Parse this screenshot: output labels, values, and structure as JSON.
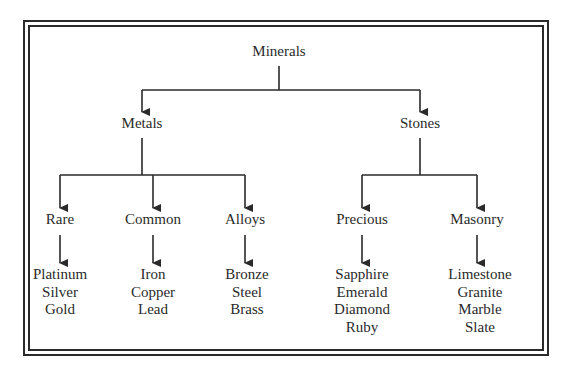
{
  "diagram": {
    "type": "tree",
    "root": "Minerals",
    "line_color": "#2a2a2a",
    "levels": {
      "level1": [
        {
          "label": "Metals"
        },
        {
          "label": "Stones"
        }
      ],
      "level2": [
        {
          "label": "Rare",
          "parent": "Metals",
          "items": [
            "Platinum",
            "Silver",
            "Gold"
          ]
        },
        {
          "label": "Common",
          "parent": "Metals",
          "items": [
            "Iron",
            "Copper",
            "Lead"
          ]
        },
        {
          "label": "Alloys",
          "parent": "Metals",
          "items": [
            "Bronze",
            "Steel",
            "Brass"
          ]
        },
        {
          "label": "Precious",
          "parent": "Stones",
          "items": [
            "Sapphire",
            "Emerald",
            "Diamond",
            "Ruby"
          ]
        },
        {
          "label": "Masonry",
          "parent": "Stones",
          "items": [
            "Limestone",
            "Granite",
            "Marble",
            "Slate"
          ]
        }
      ]
    }
  }
}
